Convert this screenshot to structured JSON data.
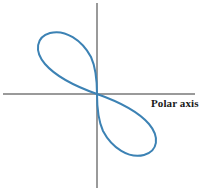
{
  "figure": {
    "background_color": "#ffffff",
    "width": 200,
    "height": 193
  },
  "axes": {
    "color": "#9a9a9a",
    "origin": {
      "x": 97,
      "y": 94
    },
    "horizontal": {
      "name": "polar-axis",
      "x1": 3,
      "y1": 94,
      "x2": 195,
      "y2": 94
    },
    "vertical": {
      "name": "vertical-axis",
      "x1": 97,
      "y1": 3,
      "x2": 97,
      "y2": 188
    },
    "label": "Polar axis"
  },
  "curve": {
    "color": "#3c82b4",
    "stroke_width": 2,
    "name": "lemniscate-curve"
  },
  "chart_data": {
    "type": "line",
    "title": "",
    "subtitle": "",
    "xlabel": "Polar axis",
    "ylabel": "",
    "grid": false,
    "legend": [],
    "annotations": [
      {
        "text": "Polar axis",
        "x": 151,
        "y": 103
      }
    ],
    "coordinate_system": "polar",
    "axis_ranges": {
      "xlim": [
        -1.6,
        1.6
      ],
      "ylim": [
        -1.6,
        1.6
      ]
    },
    "series": [
      {
        "name": "loop-upper-left",
        "color": "#3c82b4",
        "points_px": [
          [
            97,
            94
          ],
          [
            88,
            91
          ],
          [
            78,
            87
          ],
          [
            68,
            82
          ],
          [
            59,
            76
          ],
          [
            51,
            69
          ],
          [
            45,
            61
          ],
          [
            41,
            53
          ],
          [
            39,
            45
          ],
          [
            41,
            39
          ],
          [
            46,
            35
          ],
          [
            53,
            33
          ],
          [
            61,
            33
          ],
          [
            69,
            36
          ],
          [
            77,
            41
          ],
          [
            84,
            49
          ],
          [
            90,
            58
          ],
          [
            94,
            68
          ],
          [
            96,
            79
          ],
          [
            97,
            88
          ],
          [
            97,
            94
          ]
        ]
      },
      {
        "name": "loop-lower-right",
        "color": "#3c82b4",
        "points_px": [
          [
            97,
            94
          ],
          [
            106,
            97
          ],
          [
            116,
            101
          ],
          [
            126,
            106
          ],
          [
            135,
            112
          ],
          [
            143,
            119
          ],
          [
            149,
            127
          ],
          [
            153,
            135
          ],
          [
            155,
            143
          ],
          [
            153,
            149
          ],
          [
            148,
            153
          ],
          [
            141,
            155
          ],
          [
            133,
            155
          ],
          [
            125,
            152
          ],
          [
            117,
            147
          ],
          [
            110,
            139
          ],
          [
            104,
            130
          ],
          [
            100,
            120
          ],
          [
            98,
            109
          ],
          [
            97,
            100
          ],
          [
            97,
            94
          ]
        ]
      }
    ]
  }
}
